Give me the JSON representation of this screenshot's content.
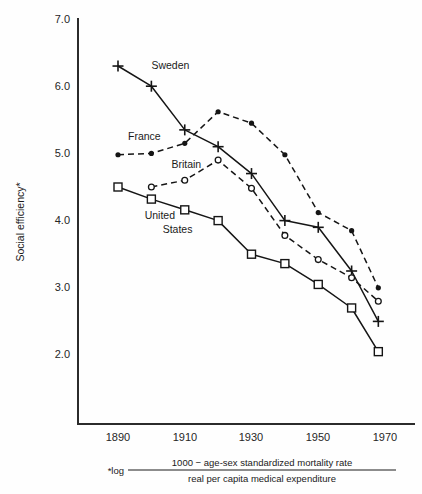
{
  "chart_data": {
    "type": "line",
    "title": "",
    "xlabel": "",
    "ylabel": "Social efficiency*",
    "footnote_prefix": "*log",
    "footnote_numerator": "1000  −  age-sex standardized mortality rate",
    "footnote_denominator": "real per capita medical expenditure",
    "x": [
      1890,
      1900,
      1910,
      1920,
      1930,
      1940,
      1950,
      1960,
      1968
    ],
    "xlim": [
      1882,
      1975
    ],
    "ylim": [
      1.55,
      7.0
    ],
    "xticks": [
      1890,
      1910,
      1930,
      1950,
      1970
    ],
    "xtick_labels": [
      "1890",
      "1910",
      "1930",
      "1950",
      "1970"
    ],
    "yticks": [
      2.0,
      3.0,
      4.0,
      5.0,
      6.0,
      7.0
    ],
    "ytick_labels": [
      "2.0",
      "3.0",
      "4.0",
      "5.0",
      "6.0",
      "7.0"
    ],
    "grid": false,
    "legend": "inline-labels",
    "series": [
      {
        "name": "Sweden",
        "marker": "plus",
        "linestyle": "solid",
        "label_x": 1900,
        "label_y": 6.25,
        "x": [
          1890,
          1900,
          1910,
          1920,
          1930,
          1940,
          1950,
          1960,
          1968
        ],
        "values": [
          6.3,
          6.0,
          5.35,
          5.1,
          4.7,
          4.0,
          3.9,
          3.25,
          2.5
        ]
      },
      {
        "name": "France",
        "marker": "dot",
        "linestyle": "dashed",
        "label_x": 1893,
        "label_y": 5.2,
        "x": [
          1890,
          1900,
          1910,
          1920,
          1930,
          1940,
          1950,
          1960,
          1968
        ],
        "values": [
          4.98,
          5.0,
          5.15,
          5.62,
          5.45,
          4.98,
          4.12,
          3.85,
          3.0
        ]
      },
      {
        "name": "Britain",
        "marker": "circle",
        "linestyle": "dashed",
        "label_x": 1906,
        "label_y": 4.78,
        "x": [
          1900,
          1910,
          1920,
          1930,
          1940,
          1950,
          1960,
          1968
        ],
        "values": [
          4.5,
          4.6,
          4.9,
          4.48,
          3.78,
          3.42,
          3.15,
          2.8
        ]
      },
      {
        "name": "United States",
        "label_line1": "United",
        "label_line2": "States",
        "marker": "square",
        "linestyle": "solid",
        "label_x": 1898,
        "label_y": 4.02,
        "x": [
          1890,
          1900,
          1910,
          1920,
          1930,
          1940,
          1950,
          1960,
          1968
        ],
        "values": [
          4.5,
          4.32,
          4.16,
          4.0,
          3.5,
          3.36,
          3.05,
          2.7,
          2.05
        ]
      }
    ]
  },
  "colors": {
    "ink": "#151515",
    "axis": "#2b2b2b",
    "background": "#fefefe"
  }
}
